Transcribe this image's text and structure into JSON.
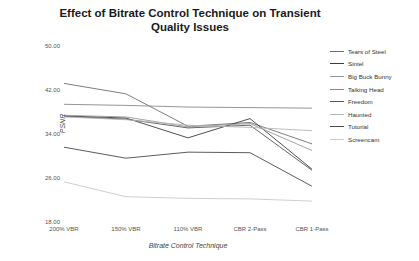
{
  "chart_data": {
    "type": "line",
    "title": "Effect of Bitrate Control Technique on Transient Quality Issues",
    "xlabel": "Bitrate Control Technique",
    "ylabel": "PSNR",
    "categories": [
      "200% VBR",
      "150% VBR",
      "110% VBR",
      "CBR 2-Pass",
      "CBR 1-Pass"
    ],
    "ylim": [
      18.0,
      50.0
    ],
    "yticks": [
      "50.00",
      "42.00",
      "34.00",
      "26.00",
      "18.00"
    ],
    "ytick_values": [
      50.0,
      42.0,
      34.0,
      26.0,
      18.0
    ],
    "grid": false,
    "legend_position": "right",
    "series": [
      {
        "name": "Tears of Steel",
        "color": "#6f6f6f",
        "values": [
          43.2,
          41.3,
          35.4,
          36.1,
          32.2
        ]
      },
      {
        "name": "Sintel",
        "color": "#3c3c3c",
        "values": [
          37.3,
          36.9,
          33.3,
          36.8,
          27.6
        ]
      },
      {
        "name": "Big Buck Bunny",
        "color": "#9a9a9a",
        "values": [
          37.4,
          37.1,
          35.3,
          35.9,
          31.0
        ]
      },
      {
        "name": "Talking Head",
        "color": "#8a8a8a",
        "values": [
          39.4,
          39.2,
          38.9,
          38.8,
          38.7
        ]
      },
      {
        "name": "Freedom",
        "color": "#585858",
        "values": [
          37.2,
          36.7,
          35.1,
          35.6,
          27.4
        ]
      },
      {
        "name": "Haunted",
        "color": "#b5b5b5",
        "values": [
          37.1,
          36.6,
          35.6,
          35.2,
          34.6
        ]
      },
      {
        "name": "Tutorial",
        "color": "#4a4a4a",
        "values": [
          31.6,
          29.6,
          30.7,
          30.6,
          24.5
        ]
      },
      {
        "name": "Screencam",
        "color": "#cacaca",
        "values": [
          25.3,
          22.6,
          22.3,
          22.2,
          21.8
        ]
      }
    ]
  }
}
